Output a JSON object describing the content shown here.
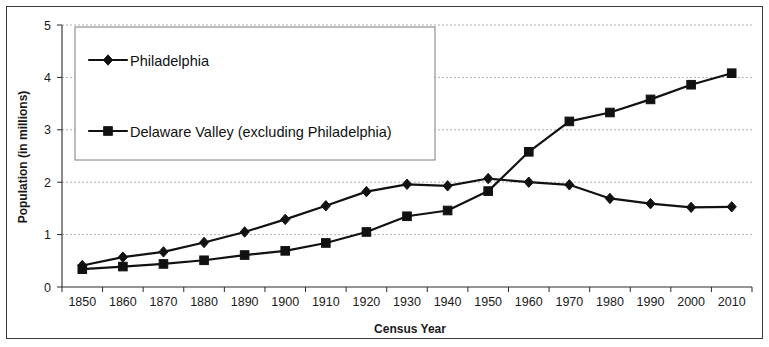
{
  "chart_data": {
    "type": "line",
    "title": "",
    "xlabel": "Census Year",
    "ylabel": "Population (in millions)",
    "categories": [
      "1850",
      "1860",
      "1870",
      "1880",
      "1890",
      "1900",
      "1910",
      "1920",
      "1930",
      "1940",
      "1950",
      "1960",
      "1970",
      "1980",
      "1990",
      "2000",
      "2010"
    ],
    "ylim": [
      0,
      5
    ],
    "yticks": [
      "0",
      "1",
      "2",
      "3",
      "4",
      "5"
    ],
    "grid": true,
    "legend_position": "top-left inside plot",
    "series": [
      {
        "name": "Philadelphia",
        "marker": "diamond",
        "color": "#111111",
        "values": [
          0.41,
          0.57,
          0.67,
          0.85,
          1.05,
          1.29,
          1.55,
          1.82,
          1.96,
          1.93,
          2.07,
          2.0,
          1.95,
          1.69,
          1.59,
          1.52,
          1.53
        ]
      },
      {
        "name": "Delaware Valley (excluding Philadelphia)",
        "marker": "square",
        "color": "#111111",
        "values": [
          0.34,
          0.39,
          0.44,
          0.51,
          0.61,
          0.69,
          0.84,
          1.05,
          1.35,
          1.46,
          1.83,
          2.58,
          3.16,
          3.33,
          3.58,
          3.86,
          4.08
        ]
      }
    ]
  },
  "legend": {
    "entries": [
      {
        "label": "Philadelphia"
      },
      {
        "label": "Delaware Valley (excluding Philadelphia)"
      }
    ]
  },
  "axes": {
    "y_title": "Population (in millions)",
    "x_title": "Census Year"
  }
}
